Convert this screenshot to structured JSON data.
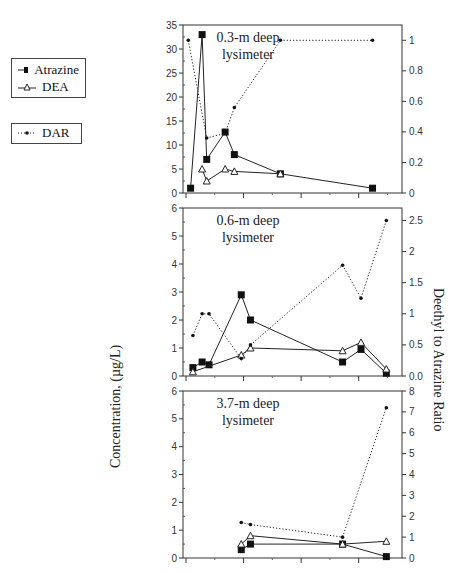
{
  "legend": {
    "items": [
      {
        "label": "Atrazine",
        "marker": "filled-square",
        "line": "solid"
      },
      {
        "label": "DEA",
        "marker": "open-triangle",
        "line": "solid"
      }
    ],
    "dar": {
      "label": "DAR",
      "marker": "dot",
      "line": "dotted"
    }
  },
  "axes": {
    "ylabel_left": "Concentration, (µg/L)",
    "ylabel_right": "Deethyl to Atrazine Ratio"
  },
  "chart_data": [
    {
      "type": "line",
      "title": "0.3-m deep lysimeter",
      "ylabel": "Concentration, (µg/L)",
      "ylabel_right": "Deethyl to Atrazine Ratio",
      "ylim": [
        0,
        35
      ],
      "ylim_right": [
        0,
        1.1
      ],
      "yticks": [
        0,
        5,
        10,
        15,
        20,
        25,
        30,
        35
      ],
      "yticks_right": [
        0,
        0.2,
        0.4,
        0.6,
        0.8,
        1
      ],
      "x": [
        1,
        2,
        3,
        4,
        5,
        6,
        7,
        8
      ],
      "series": [
        {
          "name": "Atrazine",
          "axis": "left",
          "x": [
            0.4,
            1.4,
            1.8,
            3.4,
            4.2,
            8.2,
            16.2
          ],
          "values": [
            1,
            33,
            7,
            12.7,
            8,
            4,
            1
          ]
        },
        {
          "name": "DEA",
          "axis": "left",
          "x": [
            1.4,
            1.8,
            3.4,
            4.2,
            8.2
          ],
          "values": [
            5,
            2.5,
            5,
            4.5,
            4
          ]
        },
        {
          "name": "DAR",
          "axis": "right",
          "x": [
            0.2,
            1.8,
            3.4,
            4.2,
            8.2,
            16.2
          ],
          "values": [
            1.0,
            0.36,
            0.39,
            0.56,
            1.0,
            1.0
          ]
        }
      ]
    },
    {
      "type": "line",
      "title": "0.6-m deep lysimeter",
      "ylim": [
        0,
        6
      ],
      "ylim_right": [
        0,
        2.7
      ],
      "yticks": [
        0,
        1,
        2,
        3,
        4,
        5,
        6
      ],
      "yticks_right": [
        "0.0",
        "0.5",
        "1",
        "1.5",
        "2",
        "2.5"
      ],
      "series": [
        {
          "name": "Atrazine",
          "axis": "left",
          "x": [
            0.6,
            1.4,
            2.0,
            4.8,
            5.6,
            13.6,
            15.2,
            17.4
          ],
          "values": [
            0.3,
            0.5,
            0.4,
            2.9,
            2.0,
            0.5,
            0.95,
            0.1
          ]
        },
        {
          "name": "DEA",
          "axis": "left",
          "x": [
            0.6,
            4.8,
            5.6,
            13.6,
            15.2,
            17.4
          ],
          "values": [
            0.15,
            0.75,
            1.0,
            0.9,
            1.2,
            0.25
          ]
        },
        {
          "name": "DAR",
          "axis": "right",
          "x": [
            0.6,
            1.4,
            2.0,
            4.8,
            5.6,
            13.6,
            15.2,
            17.4
          ],
          "values": [
            0.65,
            1.0,
            1.0,
            0.28,
            0.5,
            1.78,
            1.25,
            2.5
          ]
        }
      ]
    },
    {
      "type": "line",
      "title": "3.7-m deep lysimeter",
      "ylim": [
        0,
        6
      ],
      "ylim_right": [
        0,
        8
      ],
      "yticks": [
        0,
        1,
        2,
        3,
        4,
        5,
        6
      ],
      "yticks_right": [
        0,
        1,
        2,
        3,
        4,
        5,
        6,
        7,
        8
      ],
      "series": [
        {
          "name": "Atrazine",
          "axis": "left",
          "x": [
            4.8,
            5.6,
            13.6,
            17.4
          ],
          "values": [
            0.3,
            0.5,
            0.5,
            0.05
          ]
        },
        {
          "name": "DEA",
          "axis": "left",
          "x": [
            4.8,
            5.6,
            13.6,
            17.4
          ],
          "values": [
            0.5,
            0.8,
            0.5,
            0.6
          ]
        },
        {
          "name": "DAR",
          "axis": "right",
          "x": [
            4.8,
            5.6,
            13.6,
            17.4
          ],
          "values": [
            1.7,
            1.6,
            1.0,
            7.2
          ]
        }
      ]
    }
  ]
}
